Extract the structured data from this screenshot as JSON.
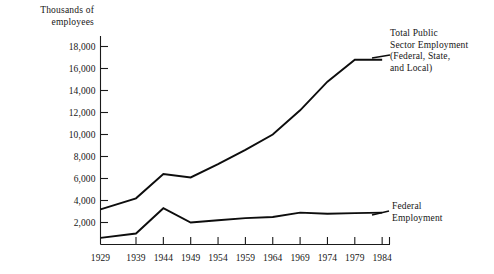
{
  "chart_data": {
    "type": "line",
    "title": "",
    "xlabel": "",
    "ylabel": "Thousands of\nemployees",
    "ylim": [
      0,
      22000
    ],
    "xlim": [
      1929,
      1984
    ],
    "grid": false,
    "legend_position": "inline-annotations",
    "x": [
      1929,
      1939,
      1944,
      1949,
      1954,
      1959,
      1964,
      1969,
      1974,
      1979,
      1984
    ],
    "xtick_labels": [
      "1929",
      "1939",
      "1944",
      "1949",
      "1954",
      "1959",
      "1964",
      "1969",
      "1974",
      "1979",
      "1984"
    ],
    "ytick_values": [
      2000,
      4000,
      6000,
      8000,
      10000,
      12000,
      14000,
      16000,
      18000
    ],
    "ytick_labels": [
      "2,000",
      "4,000",
      "6,000",
      "8,000",
      "10,000",
      "12,000",
      "14,000",
      "16,000",
      "18,000"
    ],
    "series": [
      {
        "name": "Total Public Sector Employment (Federal, State, and Local)",
        "annotation": "Total  Public\nSector  Employment\n(Federal,  State,\nand  Local)",
        "color": "#0d0d0d",
        "values": [
          3200,
          4200,
          6400,
          6100,
          7300,
          8600,
          10000,
          12200,
          14800,
          16800,
          16800
        ]
      },
      {
        "name": "Federal Employment",
        "annotation": "Federal\nEmployment",
        "color": "#0d0d0d",
        "values": [
          600,
          1000,
          3300,
          2000,
          2200,
          2400,
          2500,
          2900,
          2800,
          2850,
          2900
        ]
      }
    ]
  },
  "axis": {
    "y_title": "Thousands of\nemployees"
  },
  "annotations": {
    "total_public": "Total  Public\nSector  Employment\n(Federal,  State,\nand  Local)",
    "federal": "Federal\nEmployment"
  }
}
